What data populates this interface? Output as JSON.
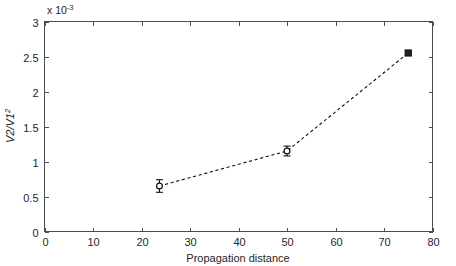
{
  "figure": {
    "background_color": "#ffffff",
    "axis_color": "#4d4d4d",
    "data_color": "#111111",
    "exponent_label": "x 10",
    "exponent_value": "-3"
  },
  "chart_data": {
    "type": "line",
    "title": "",
    "subtitle": "",
    "xlabel": "Propagation distance",
    "ylabel": "V2/V1",
    "ylabel_exponent": "2",
    "y_multiplier": "x 10^-3",
    "xlim": [
      0,
      80
    ],
    "ylim": [
      0,
      3
    ],
    "xticks": [
      0,
      10,
      20,
      30,
      40,
      50,
      60,
      70,
      80
    ],
    "xticklabels": [
      "0",
      "10",
      "20",
      "30",
      "40",
      "50",
      "60",
      "70",
      "80"
    ],
    "yticks": [
      0,
      0.5,
      1,
      1.5,
      2,
      2.5,
      3
    ],
    "yticklabels": [
      "0",
      "0.5",
      "1",
      "1.5",
      "2",
      "2.5",
      "3"
    ],
    "grid": false,
    "legend": null,
    "linestyle": "dashed",
    "series": [
      {
        "name": "V2/V1^2 vs propagation distance",
        "marker": "circle",
        "x": [
          23.7,
          50.0,
          75.0
        ],
        "y": [
          0.65,
          1.15,
          2.55
        ],
        "yerr": [
          0.09,
          0.07,
          0.03
        ],
        "markers": [
          "circle",
          "circle",
          "square"
        ]
      }
    ],
    "annotations": []
  }
}
